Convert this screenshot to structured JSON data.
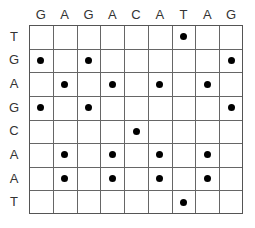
{
  "dotplot": {
    "columns": [
      "G",
      "A",
      "G",
      "A",
      "C",
      "A",
      "T",
      "A",
      "G"
    ],
    "rows": [
      "T",
      "G",
      "A",
      "G",
      "C",
      "A",
      "A",
      "T"
    ],
    "matches": [
      [
        0,
        6
      ],
      [
        1,
        0
      ],
      [
        1,
        2
      ],
      [
        1,
        8
      ],
      [
        2,
        1
      ],
      [
        2,
        3
      ],
      [
        2,
        5
      ],
      [
        2,
        7
      ],
      [
        3,
        0
      ],
      [
        3,
        2
      ],
      [
        3,
        8
      ],
      [
        4,
        4
      ],
      [
        5,
        1
      ],
      [
        5,
        3
      ],
      [
        5,
        5
      ],
      [
        5,
        7
      ],
      [
        6,
        1
      ],
      [
        6,
        3
      ],
      [
        6,
        5
      ],
      [
        6,
        7
      ],
      [
        7,
        6
      ]
    ]
  }
}
